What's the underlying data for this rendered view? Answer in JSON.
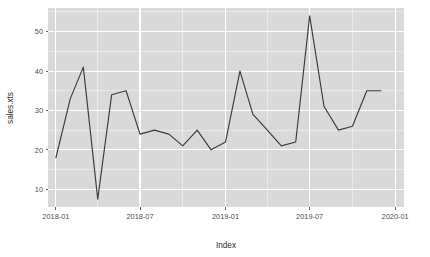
{
  "chart_data": {
    "type": "line",
    "title": "",
    "subtitle": "",
    "xlabel": "Index",
    "ylabel": "sales.xts",
    "grid": true,
    "legend": "none",
    "theme": "ggplot2-grey",
    "line_color": "#3b3b3b",
    "panel_color": "#d9d9d9",
    "grid_color": "#ffffff",
    "x_type": "date",
    "xlim": [
      "2017-12-15",
      "2020-01-20"
    ],
    "ylim": [
      5.5,
      56
    ],
    "x_tick_labels": [
      "2018-01",
      "2018-07",
      "2019-01",
      "2019-07",
      "2020-01"
    ],
    "x_tick_values": [
      "2018-01-01",
      "2018-07-01",
      "2019-01-01",
      "2019-07-01",
      "2020-01-01"
    ],
    "y_tick_labels": [
      "10",
      "20",
      "30",
      "40",
      "50"
    ],
    "y_tick_values": [
      10,
      20,
      30,
      40,
      50
    ],
    "series": [
      {
        "name": "sales.xts",
        "x": [
          "2018-01",
          "2018-02",
          "2018-03",
          "2018-04",
          "2018-05",
          "2018-06",
          "2018-07",
          "2018-08",
          "2018-09",
          "2018-10",
          "2018-11",
          "2018-12",
          "2019-01",
          "2019-02",
          "2019-03",
          "2019-04",
          "2019-05",
          "2019-06",
          "2019-07",
          "2019-08",
          "2019-09",
          "2019-10",
          "2019-11",
          "2019-12"
        ],
        "values": [
          18,
          33,
          41,
          7.5,
          34,
          35,
          24,
          25,
          24,
          21,
          25,
          20,
          22,
          40,
          29,
          25,
          21,
          22,
          54,
          31,
          25,
          26,
          35,
          35
        ]
      }
    ]
  },
  "axes": {
    "y_title": "sales.xts",
    "x_title": "Index"
  }
}
